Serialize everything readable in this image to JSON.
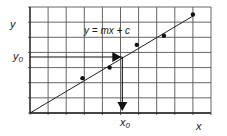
{
  "chart_data": {
    "type": "scatter",
    "title": "",
    "xlabel": "x",
    "ylabel": "y",
    "equation": "y = mx + c",
    "grid": true,
    "grid_columns": 10,
    "grid_rows": 7,
    "points": [
      {
        "x": 2.9,
        "y": 2.3
      },
      {
        "x": 4.4,
        "y": 3.0
      },
      {
        "x": 5.9,
        "y": 4.5
      },
      {
        "x": 7.4,
        "y": 5.1
      },
      {
        "x": 9.0,
        "y": 6.5
      }
    ],
    "fit_line": {
      "x0": 0,
      "y0": 0,
      "x1": 9.0,
      "y1": 6.4
    },
    "readoff": {
      "x_label": "x₀",
      "y_label": "y₀",
      "x": 5.1,
      "y": 3.7
    },
    "xlim": [
      0,
      10
    ],
    "ylim": [
      0,
      7
    ]
  },
  "labels": {
    "x_axis": "x",
    "y_axis": "y",
    "equation": "y = mx + c",
    "x0_main": "x",
    "x0_sub": "0",
    "y0_main": "y",
    "y0_sub": "0"
  }
}
